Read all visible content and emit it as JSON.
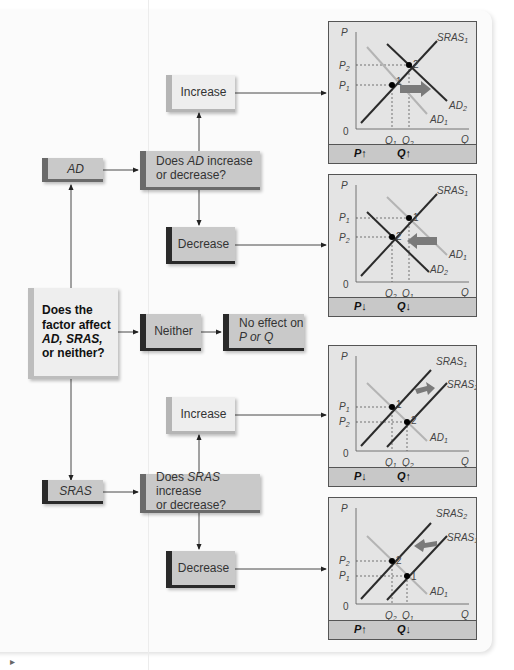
{
  "flowchart": {
    "start": {
      "line1": "Does the",
      "line2": "factor affect",
      "line3": "AD, SRAS,",
      "line4": "or neither?"
    },
    "ad_box": {
      "label": "AD"
    },
    "sras_box": {
      "label": "SRAS"
    },
    "neither_box": {
      "label": "Neither"
    },
    "no_effect_box": {
      "line1": "No effect on",
      "line2": "P or Q"
    },
    "ad_question": {
      "pre": "Does ",
      "subject": "AD",
      "post": " increase",
      "line2": "or decrease?"
    },
    "sras_question": {
      "pre": "Does ",
      "subject": "SRAS",
      "post": " increase",
      "line2": "or decrease?"
    },
    "ad_increase": {
      "label": "Increase"
    },
    "ad_decrease": {
      "label": "Decrease"
    },
    "sras_increase": {
      "label": "Increase"
    },
    "sras_decrease": {
      "label": "Decrease"
    }
  },
  "charts": [
    {
      "id": "ad-increase",
      "p_effect": "P↑",
      "q_effect": "Q↑",
      "labels": {
        "p": "P",
        "q": "Q",
        "zero": "0",
        "p_top": "P2",
        "p_bot": "P1",
        "q_left": "Q1",
        "q_right": "Q2",
        "curve_a": "SRAS1",
        "curve_b": "AD2",
        "curve_c": "AD1",
        "pt1": "1",
        "pt2": "2"
      }
    },
    {
      "id": "ad-decrease",
      "p_effect": "P↓",
      "q_effect": "Q↓",
      "labels": {
        "p": "P",
        "q": "Q",
        "zero": "0",
        "p_top": "P1",
        "p_bot": "P2",
        "q_left": "Q2",
        "q_right": "Q1",
        "curve_a": "SRAS1",
        "curve_b": "AD1",
        "curve_c": "AD2",
        "pt1": "1",
        "pt2": "2"
      }
    },
    {
      "id": "sras-increase",
      "p_effect": "P↓",
      "q_effect": "Q↑",
      "labels": {
        "p": "P",
        "q": "Q",
        "zero": "0",
        "p_top": "P1",
        "p_bot": "P2",
        "q_left": "Q1",
        "q_right": "Q2",
        "curve_a": "SRAS1",
        "curve_b": "SRAS2",
        "curve_c": "AD1",
        "pt1": "1",
        "pt2": "2"
      }
    },
    {
      "id": "sras-decrease",
      "p_effect": "P↑",
      "q_effect": "Q↓",
      "labels": {
        "p": "P",
        "q": "Q",
        "zero": "0",
        "p_top": "P2",
        "p_bot": "P1",
        "q_left": "Q2",
        "q_right": "Q1",
        "curve_a": "SRAS2",
        "curve_b": "SRAS1",
        "curve_c": "AD1",
        "pt1": "1",
        "pt2": "2"
      }
    }
  ],
  "colors": {
    "panel_bg": "#fbfbfb",
    "chart_bg": "#e4e4e4",
    "chart_footer": "#c8c8c8",
    "curve_dark": "#2b2b2b",
    "curve_light": "#b4b4b4",
    "shift_arrow": "#7a7a7a"
  }
}
